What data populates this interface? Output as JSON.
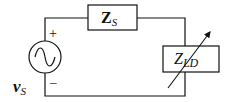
{
  "diagram": {
    "type": "circuit",
    "source": {
      "label_main": "v",
      "label_sub": "S",
      "plus": "+",
      "minus": "–",
      "icon": "ac-source-icon"
    },
    "source_impedance": {
      "label_main": "Z",
      "label_sub": "S"
    },
    "load_impedance": {
      "label_main": "Z",
      "label_sub": "LD",
      "variable": true,
      "icon": "variable-arrow-icon"
    },
    "colors": {
      "line": "#111111",
      "background": "#ffffff"
    }
  }
}
